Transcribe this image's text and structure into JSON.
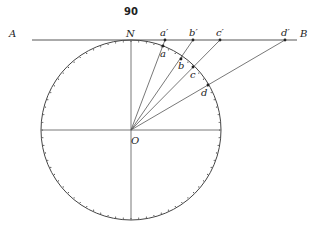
{
  "page_number": "90",
  "geometry": {
    "center": {
      "x": 131,
      "y": 130
    },
    "radius": 90,
    "tangent_line": {
      "x1": 32,
      "x2": 297,
      "y": 40
    }
  },
  "labels": {
    "A": "A",
    "B": "B",
    "N": "N",
    "O": "O",
    "a": "a",
    "b": "b",
    "c": "c",
    "d": "d",
    "a_prime": "a′",
    "b_prime": "b′",
    "c_prime": "c′",
    "d_prime": "d′",
    "bottom": "Δ"
  },
  "points": {
    "a_prime": {
      "x": 165,
      "y": 40
    },
    "b_prime": {
      "x": 193,
      "y": 40
    },
    "c_prime": {
      "x": 220,
      "y": 40
    },
    "d_prime": {
      "x": 285,
      "y": 40
    },
    "a": {
      "x": 163,
      "y": 46
    },
    "b": {
      "x": 181,
      "y": 59
    },
    "c": {
      "x": 194,
      "y": 66
    },
    "d": {
      "x": 208,
      "y": 85
    }
  },
  "colors": {
    "ink": "#333333",
    "background": "#ffffff"
  }
}
